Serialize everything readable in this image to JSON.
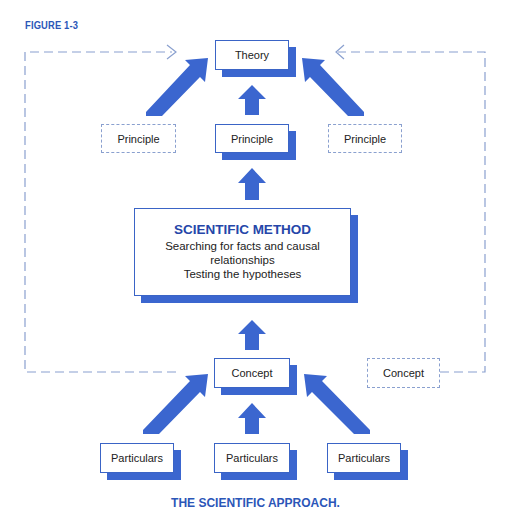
{
  "figure_label": "FIGURE 1-3",
  "caption": "THE SCIENTIFIC APPROACH.",
  "colors": {
    "accent": "#3b66cf",
    "title_blue": "#2546a9",
    "dashed": "#8aa0cf"
  },
  "nodes": {
    "theory": "Theory",
    "principle_left": "Principle",
    "principle_center": "Principle",
    "principle_right": "Principle",
    "method": {
      "title": "SCIENTIFIC METHOD",
      "line1": "Searching for facts and causal relationships",
      "line2": "Testing the hypotheses"
    },
    "concept_center": "Concept",
    "concept_right": "Concept",
    "particulars_left": "Particulars",
    "particulars_center": "Particulars",
    "particulars_right": "Particulars"
  }
}
